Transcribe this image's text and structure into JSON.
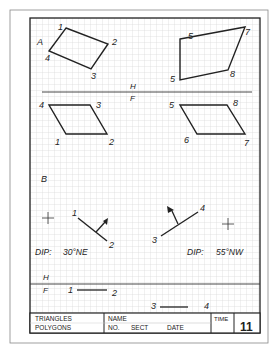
{
  "worksheet": {
    "views": {
      "top_left_view_label": "A",
      "fold_line_1": {
        "upper": "H",
        "lower": "F"
      },
      "section_b_label": "B",
      "fold_line_2": {
        "upper": "H",
        "lower": "F"
      }
    },
    "polygon_a_top": {
      "vertices": [
        "1",
        "2",
        "3",
        "4"
      ]
    },
    "polygon_b_top": {
      "vertices": [
        "5",
        "6",
        "7",
        "8"
      ]
    },
    "polygon_a_front": {
      "vertices": [
        "1",
        "2",
        "3",
        "4"
      ]
    },
    "polygon_b_front": {
      "vertices": [
        "5",
        "6",
        "7",
        "8"
      ]
    },
    "strike_1": {
      "point_labels": [
        "1",
        "2"
      ],
      "dip_label": "DIP:",
      "dip_value": "30°NE"
    },
    "strike_2": {
      "point_labels": [
        "3",
        "4"
      ],
      "dip_label": "DIP:",
      "dip_value": "55°NW"
    },
    "front_line_1": {
      "point_labels": [
        "1",
        "2"
      ]
    },
    "front_line_2": {
      "point_labels": [
        "3",
        "4"
      ]
    }
  },
  "title_block": {
    "subject_line1": "TRIANGLES",
    "subject_line2": "POLYGONS",
    "name_label": "NAME",
    "no_label": "NO.",
    "sect_label": "SECT",
    "date_label": "DATE",
    "time_label": "TIME",
    "sheet_number": "11"
  },
  "colors": {
    "ink": "#222222",
    "grid": "#c8c8c8",
    "paper": "#ffffff"
  }
}
